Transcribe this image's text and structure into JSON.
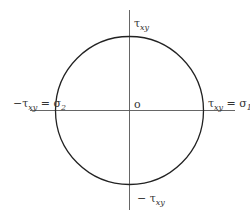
{
  "diagram": {
    "type": "mohr-circle",
    "colors": {
      "stroke": "#222222",
      "axis": "#555555",
      "text": "#333333",
      "background": "#ffffff"
    },
    "labels": {
      "top": {
        "sym": "τ",
        "sub": "xy"
      },
      "bottom": {
        "pre": "− ",
        "sym": "τ",
        "sub": "xy"
      },
      "left": {
        "pre": "−",
        "sym": "τ",
        "sub": "xy",
        "eq": " = σ",
        "eqsub": "2"
      },
      "right": {
        "sym": "τ",
        "sub": "xy",
        "eq": " = σ",
        "eqsub": "1"
      },
      "origin": "o"
    }
  }
}
